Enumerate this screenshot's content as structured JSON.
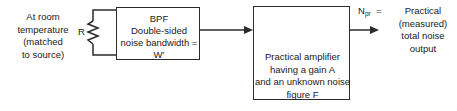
{
  "diagram": {
    "source": {
      "note_lines": [
        "At room",
        "temperature",
        "(matched",
        "to source)"
      ],
      "resistor_label": "R",
      "resistor_icon": "resistor-zigzag-icon"
    },
    "bpf": {
      "lines": [
        "BPF",
        "Double-sided",
        "noise bandwidth =",
        "W'"
      ]
    },
    "amplifier": {
      "symbol_icon": "amplifier-triangle-icon",
      "lines": [
        "Practical amplifier",
        "having a gain A",
        "and an unknown noise",
        "figure F"
      ]
    },
    "output": {
      "symbol": "N",
      "subscript": "pr",
      "equals": "=",
      "description_lines": [
        "Practical",
        "(measured)",
        "total noise",
        "output"
      ]
    },
    "colors": {
      "line": "#2b2b2b",
      "text": "#1a1a1a",
      "background": "#ffffff"
    }
  }
}
